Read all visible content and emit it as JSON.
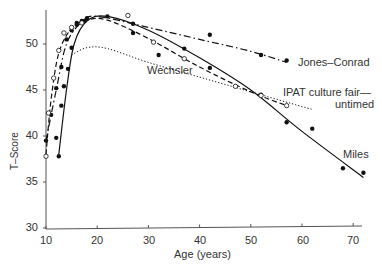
{
  "chart_data": {
    "type": "line",
    "title": "",
    "xlabel": "Age (years)",
    "ylabel": "T–Score",
    "xlim": [
      10,
      72
    ],
    "ylim": [
      30,
      53.5
    ],
    "xticks": [
      10,
      20,
      30,
      40,
      50,
      60,
      70
    ],
    "yticks": [
      30,
      35,
      40,
      45,
      50
    ],
    "grid": false,
    "legend": "inline labels",
    "series": [
      {
        "name": "Jones–Conrad",
        "line_style": "dash-dot",
        "marker": "filled",
        "points": [
          [
            10,
            39.5
          ],
          [
            11,
            42.3
          ],
          [
            12,
            45.2
          ],
          [
            13,
            47.5
          ],
          [
            14,
            50.5
          ],
          [
            15,
            51.5
          ],
          [
            16,
            52.3
          ],
          [
            17,
            52.5
          ],
          [
            18,
            52.8
          ],
          [
            22,
            53.0
          ],
          [
            27,
            52.2
          ],
          [
            27,
            51.2
          ],
          [
            42,
            51.0
          ],
          [
            52,
            48.8
          ],
          [
            57,
            48.2
          ]
        ],
        "curve": [
          [
            10,
            39.5
          ],
          [
            12,
            45
          ],
          [
            14,
            50
          ],
          [
            17,
            52.4
          ],
          [
            20,
            53
          ],
          [
            30,
            51.8
          ],
          [
            40,
            50.5
          ],
          [
            50,
            49.2
          ],
          [
            57,
            48
          ]
        ]
      },
      {
        "name": "Miles",
        "line_style": "solid",
        "marker": "filled",
        "points": [
          [
            12,
            39.8
          ],
          [
            12.5,
            37.8
          ],
          [
            13,
            43.3
          ],
          [
            13.5,
            45.4
          ],
          [
            14.3,
            47.3
          ],
          [
            15,
            49.6
          ],
          [
            16,
            52.1
          ],
          [
            17.5,
            52.5
          ],
          [
            32,
            48.8
          ],
          [
            37,
            49.5
          ],
          [
            42,
            47.4
          ],
          [
            52,
            44.5
          ],
          [
            57,
            41.5
          ],
          [
            62,
            40.8
          ],
          [
            68,
            36.5
          ],
          [
            72,
            36.0
          ]
        ],
        "curve": [
          [
            12.5,
            38
          ],
          [
            14,
            45
          ],
          [
            15.5,
            50
          ],
          [
            18,
            52.5
          ],
          [
            22,
            53
          ],
          [
            30,
            51.5
          ],
          [
            40,
            48.5
          ],
          [
            50,
            45
          ],
          [
            60,
            40.5
          ],
          [
            72,
            35.5
          ]
        ]
      },
      {
        "name": "Wechsler",
        "line_style": "dotted",
        "marker": "none",
        "curve": [
          [
            15,
            48.8
          ],
          [
            18,
            49.6
          ],
          [
            22,
            49.5
          ],
          [
            30,
            48.0
          ],
          [
            40,
            46.4
          ],
          [
            50,
            44.8
          ],
          [
            60,
            43.2
          ],
          [
            62,
            42.9
          ]
        ]
      },
      {
        "name": "IPAT culture fair—untimed",
        "line_style": "dashed",
        "marker": "open",
        "points": [
          [
            10,
            37.8
          ],
          [
            10.5,
            42.5
          ],
          [
            11.5,
            46.3
          ],
          [
            12.5,
            49.3
          ],
          [
            13.5,
            51.2
          ],
          [
            15,
            51.8
          ],
          [
            17,
            52.3
          ],
          [
            26,
            53.1
          ],
          [
            31,
            50.2
          ],
          [
            37,
            48.4
          ],
          [
            47,
            45.4
          ],
          [
            52,
            44.4
          ],
          [
            57,
            43.3
          ]
        ],
        "curve": [
          [
            10,
            38
          ],
          [
            11,
            44
          ],
          [
            12.5,
            49
          ],
          [
            15,
            51.7
          ],
          [
            18,
            52.6
          ],
          [
            22,
            52.6
          ],
          [
            30,
            50.6
          ],
          [
            40,
            47.5
          ],
          [
            50,
            44.8
          ],
          [
            57,
            43.3
          ]
        ]
      }
    ],
    "annotations": [
      {
        "text": "Jones–Conrad",
        "x": 60,
        "y": 48.3
      },
      {
        "text": "Wechsler",
        "x": 29,
        "y": 46.7
      },
      {
        "text": "IPAT culture fair—",
        "x": 52,
        "y": 44.6
      },
      {
        "text": "untimed",
        "x": 56,
        "y": 43.3
      },
      {
        "text": "Miles",
        "x": 66,
        "y": 39.2
      }
    ]
  },
  "labels": {
    "xlabel": "Age (years)",
    "ylabel": "T–Score",
    "jones": "Jones–Conrad",
    "wechsler": "Wechsler",
    "ipat1": "IPAT culture fair—",
    "ipat2": "untimed",
    "miles": "Miles",
    "y30": "30",
    "y35": "35",
    "y40": "40",
    "y45": "45",
    "y50": "50",
    "x10": "10",
    "x20": "20",
    "x30": "30",
    "x40": "40",
    "x50": "50",
    "x60": "60",
    "x70": "70"
  }
}
